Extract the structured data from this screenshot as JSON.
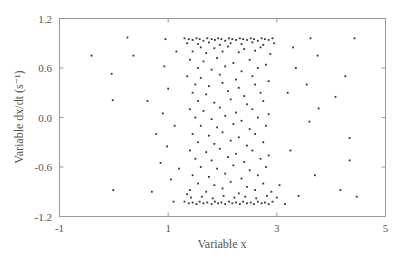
{
  "chart_data": {
    "type": "scatter",
    "title": "",
    "xlabel": "Variable x",
    "ylabel": "Variable dx/dt (s⁻¹)",
    "xlim": [
      -1,
      5
    ],
    "ylim": [
      -1.2,
      1.2
    ],
    "xticks": [
      -1,
      1,
      3,
      5
    ],
    "xtick_labels": [
      "-1",
      "1",
      "3",
      "5"
    ],
    "yticks": [
      1.2,
      0.6,
      0.0,
      -0.6,
      -1.2
    ],
    "ytick_labels": [
      "1.2",
      "0.6",
      "0.0",
      "-0.6",
      "-1.2"
    ],
    "grid": false,
    "legend": null,
    "marker_color": "#333333",
    "frame_color": "#9a9a9a",
    "series": [
      {
        "name": "points",
        "points": [
          [
            -0.41,
            0.75
          ],
          [
            -0.04,
            0.53
          ],
          [
            -0.02,
            0.21
          ],
          [
            0.25,
            0.97
          ],
          [
            0.36,
            0.75
          ],
          [
            -0.01,
            -0.88
          ],
          [
            0.62,
            0.2
          ],
          [
            0.78,
            -0.2
          ],
          [
            0.7,
            -0.9
          ],
          [
            0.86,
            -0.55
          ],
          [
            0.95,
            0.95
          ],
          [
            0.93,
            0.62
          ],
          [
            1.0,
            0.35
          ],
          [
            0.9,
            0.05
          ],
          [
            0.98,
            -0.35
          ],
          [
            1.05,
            -0.75
          ],
          [
            1.1,
            -1.02
          ],
          [
            1.15,
            0.8
          ],
          [
            1.12,
            -0.1
          ],
          [
            1.2,
            -0.62
          ],
          [
            3.62,
            0.96
          ],
          [
            4.43,
            0.96
          ],
          [
            3.75,
            0.75
          ],
          [
            4.26,
            0.5
          ],
          [
            4.08,
            0.25
          ],
          [
            3.77,
            0.11
          ],
          [
            3.6,
            -0.05
          ],
          [
            4.34,
            -0.25
          ],
          [
            4.34,
            -0.52
          ],
          [
            4.47,
            -0.96
          ],
          [
            4.17,
            -0.88
          ],
          [
            3.7,
            -0.7
          ],
          [
            3.4,
            -0.95
          ],
          [
            3.55,
            0.4
          ],
          [
            3.35,
            0.6
          ],
          [
            3.2,
            0.3
          ],
          [
            3.25,
            -0.4
          ],
          [
            3.15,
            -1.05
          ],
          [
            3.05,
            -0.82
          ],
          [
            3.3,
            0.85
          ],
          [
            1.3,
            0.96
          ],
          [
            1.38,
            0.95
          ],
          [
            1.45,
            0.94
          ],
          [
            1.52,
            0.96
          ],
          [
            1.58,
            0.95
          ],
          [
            1.65,
            0.93
          ],
          [
            1.72,
            0.96
          ],
          [
            1.8,
            0.95
          ],
          [
            1.86,
            0.94
          ],
          [
            1.92,
            0.96
          ],
          [
            1.98,
            0.95
          ],
          [
            2.05,
            0.93
          ],
          [
            2.12,
            0.96
          ],
          [
            2.18,
            0.95
          ],
          [
            2.25,
            0.94
          ],
          [
            2.32,
            0.96
          ],
          [
            2.38,
            0.95
          ],
          [
            2.45,
            0.94
          ],
          [
            2.52,
            0.96
          ],
          [
            2.58,
            0.95
          ],
          [
            2.65,
            0.93
          ],
          [
            2.72,
            0.96
          ],
          [
            2.78,
            0.95
          ],
          [
            2.85,
            0.94
          ],
          [
            2.92,
            0.96
          ],
          [
            1.35,
            0.9
          ],
          [
            1.55,
            0.89
          ],
          [
            1.75,
            0.91
          ],
          [
            1.95,
            0.88
          ],
          [
            2.15,
            0.9
          ],
          [
            2.35,
            0.89
          ],
          [
            2.55,
            0.91
          ],
          [
            2.75,
            0.88
          ],
          [
            2.95,
            0.9
          ],
          [
            1.6,
            0.85
          ],
          [
            1.85,
            0.84
          ],
          [
            2.1,
            0.86
          ],
          [
            2.4,
            0.83
          ],
          [
            2.7,
            0.85
          ],
          [
            1.45,
            0.8
          ],
          [
            1.7,
            0.78
          ],
          [
            2.0,
            0.8
          ],
          [
            2.3,
            0.79
          ],
          [
            2.6,
            0.81
          ],
          [
            2.88,
            0.77
          ],
          [
            1.4,
            0.7
          ],
          [
            1.65,
            0.68
          ],
          [
            1.9,
            0.72
          ],
          [
            2.2,
            0.66
          ],
          [
            2.5,
            0.7
          ],
          [
            2.8,
            0.64
          ],
          [
            1.55,
            0.6
          ],
          [
            1.8,
            0.58
          ],
          [
            2.05,
            0.62
          ],
          [
            2.35,
            0.56
          ],
          [
            2.65,
            0.6
          ],
          [
            1.35,
            0.5
          ],
          [
            1.6,
            0.48
          ],
          [
            1.95,
            0.52
          ],
          [
            2.25,
            0.46
          ],
          [
            2.55,
            0.5
          ],
          [
            2.85,
            0.44
          ],
          [
            1.5,
            0.4
          ],
          [
            1.75,
            0.38
          ],
          [
            2.0,
            0.42
          ],
          [
            2.3,
            0.36
          ],
          [
            2.6,
            0.4
          ],
          [
            1.45,
            0.3
          ],
          [
            1.7,
            0.28
          ],
          [
            2.1,
            0.32
          ],
          [
            2.4,
            0.26
          ],
          [
            2.7,
            0.3
          ],
          [
            1.55,
            0.2
          ],
          [
            1.85,
            0.18
          ],
          [
            2.15,
            0.22
          ],
          [
            2.45,
            0.16
          ],
          [
            2.75,
            0.2
          ],
          [
            1.4,
            0.1
          ],
          [
            1.65,
            0.08
          ],
          [
            1.95,
            0.12
          ],
          [
            2.25,
            0.06
          ],
          [
            2.55,
            0.1
          ],
          [
            2.85,
            0.04
          ],
          [
            1.5,
            0.0
          ],
          [
            1.8,
            -0.02
          ],
          [
            2.05,
            0.02
          ],
          [
            2.35,
            -0.04
          ],
          [
            2.65,
            0.0
          ],
          [
            1.6,
            -0.1
          ],
          [
            1.9,
            -0.12
          ],
          [
            2.2,
            -0.08
          ],
          [
            2.5,
            -0.14
          ],
          [
            2.8,
            -0.1
          ],
          [
            1.45,
            -0.2
          ],
          [
            1.75,
            -0.22
          ],
          [
            2.0,
            -0.18
          ],
          [
            2.3,
            -0.24
          ],
          [
            2.6,
            -0.2
          ],
          [
            1.55,
            -0.3
          ],
          [
            1.85,
            -0.32
          ],
          [
            2.15,
            -0.28
          ],
          [
            2.45,
            -0.34
          ],
          [
            2.75,
            -0.3
          ],
          [
            1.4,
            -0.4
          ],
          [
            1.7,
            -0.42
          ],
          [
            1.95,
            -0.38
          ],
          [
            2.25,
            -0.44
          ],
          [
            2.55,
            -0.4
          ],
          [
            2.85,
            -0.46
          ],
          [
            1.5,
            -0.5
          ],
          [
            1.8,
            -0.52
          ],
          [
            2.1,
            -0.48
          ],
          [
            2.4,
            -0.54
          ],
          [
            2.7,
            -0.5
          ],
          [
            1.6,
            -0.6
          ],
          [
            1.9,
            -0.62
          ],
          [
            2.2,
            -0.58
          ],
          [
            2.5,
            -0.64
          ],
          [
            2.8,
            -0.6
          ],
          [
            1.45,
            -0.7
          ],
          [
            1.75,
            -0.72
          ],
          [
            2.05,
            -0.68
          ],
          [
            2.35,
            -0.74
          ],
          [
            2.65,
            -0.7
          ],
          [
            1.55,
            -0.8
          ],
          [
            1.85,
            -0.82
          ],
          [
            2.15,
            -0.78
          ],
          [
            2.45,
            -0.84
          ],
          [
            2.75,
            -0.8
          ],
          [
            1.4,
            -0.88
          ],
          [
            1.7,
            -0.9
          ],
          [
            2.0,
            -0.86
          ],
          [
            2.3,
            -0.92
          ],
          [
            2.6,
            -0.88
          ],
          [
            2.9,
            -0.9
          ],
          [
            1.3,
            -1.02
          ],
          [
            1.38,
            -1.04
          ],
          [
            1.45,
            -1.03
          ],
          [
            1.52,
            -1.05
          ],
          [
            1.58,
            -1.02
          ],
          [
            1.65,
            -1.04
          ],
          [
            1.72,
            -1.03
          ],
          [
            1.8,
            -1.05
          ],
          [
            1.86,
            -1.02
          ],
          [
            1.92,
            -1.04
          ],
          [
            1.98,
            -1.03
          ],
          [
            2.05,
            -1.05
          ],
          [
            2.12,
            -1.02
          ],
          [
            2.18,
            -1.04
          ],
          [
            2.25,
            -1.03
          ],
          [
            2.32,
            -1.05
          ],
          [
            2.38,
            -1.02
          ],
          [
            2.45,
            -1.04
          ],
          [
            2.52,
            -1.03
          ],
          [
            2.58,
            -1.05
          ],
          [
            2.65,
            -1.02
          ],
          [
            2.72,
            -1.04
          ],
          [
            2.78,
            -1.03
          ],
          [
            2.85,
            -1.05
          ],
          [
            2.92,
            -1.02
          ],
          [
            1.42,
            -0.97
          ],
          [
            1.62,
            -0.96
          ],
          [
            1.82,
            -0.98
          ],
          [
            2.02,
            -0.95
          ],
          [
            2.22,
            -0.97
          ],
          [
            2.42,
            -0.96
          ],
          [
            2.62,
            -0.98
          ],
          [
            2.82,
            -0.95
          ],
          [
            3.0,
            -0.97
          ],
          [
            1.35,
            -0.93
          ]
        ]
      }
    ]
  }
}
